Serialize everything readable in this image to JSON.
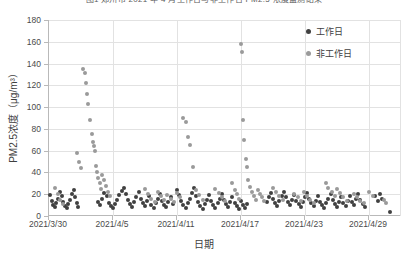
{
  "chart_data": {
    "type": "scatter",
    "title": "图1 郑州市 2021 年 4 月工作日与非工作日 PM2.5 浓度监测结果",
    "xlabel": "日期",
    "ylabel": "PM2.5浓度（μg/m³）",
    "ylim": [
      0,
      180
    ],
    "yticks": [
      0,
      20,
      40,
      60,
      80,
      100,
      120,
      140,
      160,
      180
    ],
    "xlim": [
      "2021/3/30",
      "2021/5/2"
    ],
    "xticks": [
      "2021/3/30",
      "2021/4/5",
      "2021/4/11",
      "2021/4/17",
      "2021/4/23",
      "2021/4/29"
    ],
    "xtick_days": [
      0,
      6,
      12,
      18,
      24,
      30
    ],
    "grid": "both",
    "legend_position": "top-right",
    "colors": {
      "workday": "#404040",
      "nonworkday": "#9a9a9a"
    },
    "series": [
      {
        "name": "工作日",
        "color": "#404040",
        "points": [
          [
            0.1,
            19
          ],
          [
            0.25,
            14
          ],
          [
            0.4,
            10
          ],
          [
            0.55,
            8
          ],
          [
            0.7,
            12
          ],
          [
            0.85,
            16
          ],
          [
            1.05,
            22
          ],
          [
            1.2,
            18
          ],
          [
            1.35,
            13
          ],
          [
            1.5,
            9
          ],
          [
            1.65,
            7
          ],
          [
            1.8,
            11
          ],
          [
            2.0,
            15
          ],
          [
            2.15,
            20
          ],
          [
            2.3,
            24
          ],
          [
            2.45,
            17
          ],
          [
            2.6,
            12
          ],
          [
            2.75,
            8
          ],
          [
            4.6,
            13
          ],
          [
            4.8,
            10
          ],
          [
            5.0,
            16
          ],
          [
            5.2,
            21
          ],
          [
            5.4,
            18
          ],
          [
            5.6,
            12
          ],
          [
            5.8,
            9
          ],
          [
            6.0,
            7
          ],
          [
            6.2,
            11
          ],
          [
            6.4,
            15
          ],
          [
            6.6,
            19
          ],
          [
            6.8,
            23
          ],
          [
            7.0,
            26
          ],
          [
            7.2,
            20
          ],
          [
            7.4,
            15
          ],
          [
            7.6,
            11
          ],
          [
            7.8,
            8
          ],
          [
            8.0,
            13
          ],
          [
            8.2,
            17
          ],
          [
            8.4,
            22
          ],
          [
            8.6,
            16
          ],
          [
            8.8,
            12
          ],
          [
            9.0,
            9
          ],
          [
            9.2,
            14
          ],
          [
            9.4,
            18
          ],
          [
            9.6,
            10
          ],
          [
            9.8,
            7
          ],
          [
            10.0,
            12
          ],
          [
            10.2,
            16
          ],
          [
            10.4,
            20
          ],
          [
            10.6,
            14
          ],
          [
            10.8,
            10
          ],
          [
            11.0,
            8
          ],
          [
            11.2,
            13
          ],
          [
            11.4,
            17
          ],
          [
            11.6,
            11
          ],
          [
            12.0,
            24
          ],
          [
            12.2,
            19
          ],
          [
            12.4,
            14
          ],
          [
            12.6,
            10
          ],
          [
            12.8,
            7
          ],
          [
            13.0,
            12
          ],
          [
            13.2,
            16
          ],
          [
            13.4,
            21
          ],
          [
            13.6,
            26
          ],
          [
            13.8,
            18
          ],
          [
            14.0,
            13
          ],
          [
            14.2,
            9
          ],
          [
            14.4,
            6
          ],
          [
            14.6,
            11
          ],
          [
            14.8,
            15
          ],
          [
            15.0,
            19
          ],
          [
            15.2,
            14
          ],
          [
            15.4,
            10
          ],
          [
            15.6,
            7
          ],
          [
            15.8,
            12
          ],
          [
            16.0,
            16
          ],
          [
            16.2,
            20
          ],
          [
            16.4,
            15
          ],
          [
            16.6,
            11
          ],
          [
            16.8,
            8
          ],
          [
            17.0,
            13
          ],
          [
            17.2,
            17
          ],
          [
            17.4,
            12
          ],
          [
            17.6,
            9
          ],
          [
            17.8,
            6
          ],
          [
            18.0,
            14
          ],
          [
            18.2,
            10
          ],
          [
            18.4,
            7
          ],
          [
            18.6,
            11
          ],
          [
            20.4,
            13
          ],
          [
            20.6,
            17
          ],
          [
            20.8,
            21
          ],
          [
            21.0,
            16
          ],
          [
            21.2,
            12
          ],
          [
            21.4,
            9
          ],
          [
            21.6,
            14
          ],
          [
            21.8,
            18
          ],
          [
            22.0,
            22
          ],
          [
            22.2,
            17
          ],
          [
            22.4,
            13
          ],
          [
            22.6,
            10
          ],
          [
            22.8,
            15
          ],
          [
            23.0,
            19
          ],
          [
            23.2,
            14
          ],
          [
            23.4,
            11
          ],
          [
            23.6,
            8
          ],
          [
            23.8,
            13
          ],
          [
            24.0,
            17
          ],
          [
            24.2,
            21
          ],
          [
            24.4,
            16
          ],
          [
            24.6,
            12
          ],
          [
            24.8,
            9
          ],
          [
            25.0,
            14
          ],
          [
            25.2,
            18
          ],
          [
            25.4,
            13
          ],
          [
            25.6,
            10
          ],
          [
            25.8,
            7
          ],
          [
            26.0,
            12
          ],
          [
            26.2,
            16
          ],
          [
            26.4,
            20
          ],
          [
            26.6,
            15
          ],
          [
            26.8,
            11
          ],
          [
            27.0,
            8
          ],
          [
            27.2,
            13
          ],
          [
            27.4,
            17
          ],
          [
            27.6,
            12
          ],
          [
            27.8,
            9
          ],
          [
            28.0,
            14
          ],
          [
            28.2,
            18
          ],
          [
            28.4,
            13
          ],
          [
            28.6,
            10
          ],
          [
            28.8,
            16
          ],
          [
            29.0,
            20
          ],
          [
            29.2,
            15
          ],
          [
            29.4,
            11
          ],
          [
            29.6,
            8
          ],
          [
            30.6,
            18
          ],
          [
            30.8,
            14
          ],
          [
            31.0,
            20
          ],
          [
            31.2,
            16
          ],
          [
            32.0,
            4
          ]
        ]
      },
      {
        "name": "非工作日",
        "color": "#9a9a9a",
        "points": [
          [
            0.6,
            26
          ],
          [
            0.8,
            20
          ],
          [
            1.0,
            15
          ],
          [
            1.3,
            11
          ],
          [
            2.6,
            58
          ],
          [
            2.8,
            50
          ],
          [
            3.0,
            44
          ],
          [
            3.2,
            135
          ],
          [
            3.35,
            131
          ],
          [
            3.5,
            122
          ],
          [
            3.6,
            112
          ],
          [
            3.7,
            103
          ],
          [
            3.85,
            88
          ],
          [
            4.0,
            75
          ],
          [
            4.1,
            68
          ],
          [
            4.2,
            64
          ],
          [
            4.3,
            60
          ],
          [
            4.4,
            46
          ],
          [
            4.5,
            40
          ],
          [
            4.6,
            35
          ],
          [
            4.75,
            30
          ],
          [
            4.9,
            25
          ],
          [
            5.0,
            38
          ],
          [
            5.15,
            33
          ],
          [
            5.3,
            28
          ],
          [
            5.5,
            22
          ],
          [
            5.7,
            18
          ],
          [
            9.0,
            25
          ],
          [
            9.3,
            20
          ],
          [
            9.6,
            16
          ],
          [
            9.9,
            13
          ],
          [
            10.2,
            22
          ],
          [
            10.5,
            18
          ],
          [
            10.8,
            15
          ],
          [
            11.1,
            19
          ],
          [
            11.4,
            16
          ],
          [
            11.7,
            13
          ],
          [
            12.0,
            21
          ],
          [
            12.3,
            17
          ],
          [
            12.6,
            90
          ],
          [
            12.8,
            86
          ],
          [
            13.0,
            73
          ],
          [
            13.2,
            65
          ],
          [
            13.5,
            45
          ],
          [
            13.8,
            24
          ],
          [
            14.1,
            19
          ],
          [
            14.4,
            15
          ],
          [
            15.6,
            25
          ],
          [
            15.9,
            21
          ],
          [
            16.2,
            17
          ],
          [
            16.5,
            14
          ],
          [
            17.2,
            30
          ],
          [
            17.4,
            24
          ],
          [
            17.6,
            20
          ],
          [
            17.8,
            16
          ],
          [
            18.0,
            158
          ],
          [
            18.05,
            151
          ],
          [
            18.2,
            88
          ],
          [
            18.3,
            70
          ],
          [
            18.45,
            52
          ],
          [
            18.55,
            45
          ],
          [
            18.7,
            33
          ],
          [
            18.85,
            27
          ],
          [
            19.0,
            22
          ],
          [
            19.2,
            18
          ],
          [
            19.4,
            15
          ],
          [
            19.6,
            24
          ],
          [
            19.8,
            20
          ],
          [
            20.0,
            17
          ],
          [
            20.2,
            14
          ],
          [
            21.0,
            26
          ],
          [
            21.3,
            22
          ],
          [
            21.6,
            18
          ],
          [
            21.9,
            15
          ],
          [
            23.0,
            20
          ],
          [
            23.3,
            17
          ],
          [
            23.6,
            14
          ],
          [
            23.9,
            22
          ],
          [
            24.2,
            18
          ],
          [
            24.5,
            15
          ],
          [
            24.8,
            12
          ],
          [
            26.0,
            30
          ],
          [
            26.2,
            26
          ],
          [
            26.5,
            22
          ],
          [
            26.8,
            18
          ],
          [
            27.0,
            25
          ],
          [
            27.3,
            21
          ],
          [
            27.6,
            17
          ],
          [
            27.9,
            14
          ],
          [
            28.6,
            20
          ],
          [
            28.9,
            17
          ],
          [
            29.2,
            14
          ],
          [
            29.5,
            12
          ],
          [
            30.0,
            22
          ],
          [
            30.4,
            18
          ],
          [
            31.4,
            15
          ],
          [
            31.6,
            12
          ]
        ]
      }
    ]
  }
}
